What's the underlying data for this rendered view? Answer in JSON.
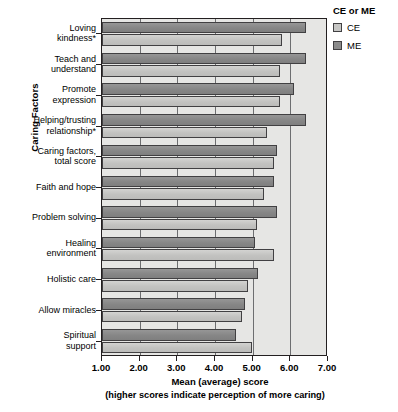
{
  "chart_data": {
    "type": "bar",
    "orientation": "horizontal",
    "title": "",
    "xlabel": "Mean (average) score",
    "xlabel_note": "(higher scores indicate perception of more caring)",
    "ylabel": "Caring Factors",
    "xlim": [
      1.0,
      7.0
    ],
    "xticks": [
      "1.00",
      "2.00",
      "3.00",
      "4.00",
      "5.00",
      "6.00",
      "7.00"
    ],
    "grid": true,
    "grid_axis": "x",
    "legend_title": "CE or ME",
    "legend_position": "right-top",
    "categories": [
      "Loving\nkindness*",
      "Teach and\nunderstand",
      "Promote\nexpression",
      "Helping/trusting\nrelationship*",
      "Caring factors,\ntotal score",
      "Faith and hope",
      "Problem solving",
      "Healing\nenvironment",
      "Holistic care",
      "Allow miracles",
      "Spiritual\nsupport"
    ],
    "series": [
      {
        "name": "ME",
        "color": "#8b8b8b",
        "values": [
          6.42,
          6.42,
          6.09,
          6.42,
          5.65,
          5.56,
          5.65,
          5.05,
          5.15,
          4.79,
          4.55
        ]
      },
      {
        "name": "CE",
        "color": "#c6c6c4",
        "values": [
          5.79,
          5.73,
          5.73,
          5.37,
          5.57,
          5.3,
          5.12,
          5.56,
          4.88,
          4.71,
          4.97
        ]
      }
    ],
    "footnote_marker": "*"
  },
  "legend": {
    "title": "CE or ME",
    "items": [
      {
        "label": "CE",
        "color": "#c6c6c4",
        "swatch": "legend-swatch-ce"
      },
      {
        "label": "ME",
        "color": "#8b8b8b",
        "swatch": "legend-swatch-me"
      }
    ]
  },
  "axes": {
    "y_title": "Caring Factors",
    "x_title": "Mean (average) score",
    "x_subtitle": "(higher scores indicate perception of more caring)"
  },
  "colors": {
    "plot_background": "#e6e6e4",
    "axis": "#231f20",
    "gridline": "#6d6e70",
    "bar_ce": "#c6c6c4",
    "bar_me": "#8b8b8b"
  }
}
